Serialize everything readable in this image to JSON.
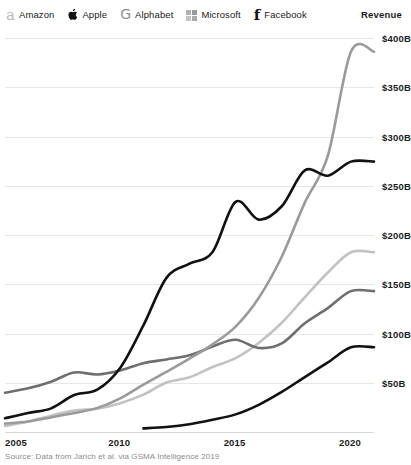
{
  "legend": {
    "revenue_label": "Revenue",
    "items": [
      {
        "label": "Amazon",
        "icon": "amazon-logo-icon",
        "color": "#9a9a9a"
      },
      {
        "label": "Apple",
        "icon": "apple-logo-icon",
        "color": "#111111"
      },
      {
        "label": "Alphabet",
        "icon": "alphabet-logo-icon",
        "color": "#c2c2c2"
      },
      {
        "label": "Microsoft",
        "icon": "microsoft-logo-icon",
        "color": "#6e6e6e"
      },
      {
        "label": "Facebook",
        "icon": "facebook-logo-icon",
        "color": "#111111"
      }
    ]
  },
  "source": "Source: Data from Jarich et al. via GSMA Intelligence 2019",
  "chart_data": {
    "type": "line",
    "title": "",
    "subtitle": "",
    "xlabel": "",
    "ylabel": "Revenue",
    "xlim": [
      2005,
      2021
    ],
    "ylim": [
      0,
      400
    ],
    "grid": true,
    "legend_position": "top",
    "x_ticks": [
      "2005",
      "2010",
      "2015",
      "2020"
    ],
    "x_tick_values": [
      2005,
      2010,
      2015,
      2020
    ],
    "y_ticks": [
      "$50B",
      "$100B",
      "$150B",
      "$200B",
      "$250B",
      "$300B",
      "$350B",
      "$400B"
    ],
    "y_tick_values": [
      50,
      100,
      150,
      200,
      250,
      300,
      350,
      400
    ],
    "unit": "Billions of US dollars",
    "x": [
      2005,
      2006,
      2007,
      2008,
      2009,
      2010,
      2011,
      2012,
      2013,
      2014,
      2015,
      2016,
      2017,
      2018,
      2019,
      2020,
      2021
    ],
    "series": [
      {
        "name": "Amazon",
        "color": "#9a9a9a",
        "values": [
          8.5,
          10.7,
          14.8,
          19.2,
          24.5,
          34.2,
          48.1,
          61.1,
          74.5,
          89.0,
          107.0,
          136.0,
          177.9,
          232.9,
          280.5,
          386.1,
          386.1
        ]
      },
      {
        "name": "Apple",
        "color": "#111111",
        "values": [
          13.9,
          19.3,
          24.0,
          37.5,
          42.9,
          65.2,
          108.2,
          156.5,
          170.9,
          182.8,
          233.7,
          215.6,
          229.2,
          265.6,
          260.2,
          274.5,
          274.5
        ]
      },
      {
        "name": "Alphabet",
        "color": "#c2c2c2",
        "values": [
          6.1,
          10.6,
          16.6,
          21.8,
          23.7,
          29.3,
          37.9,
          50.2,
          55.5,
          66.0,
          74.9,
          90.3,
          110.9,
          136.8,
          161.9,
          182.5,
          182.5
        ]
      },
      {
        "name": "Microsoft",
        "color": "#6e6e6e",
        "values": [
          39.8,
          44.3,
          51.1,
          60.4,
          58.4,
          62.5,
          69.9,
          73.7,
          77.8,
          86.8,
          93.6,
          85.3,
          89.9,
          110.4,
          125.8,
          143.0,
          143.0
        ]
      },
      {
        "name": "Facebook",
        "color": "#111111",
        "values": [
          null,
          null,
          null,
          null,
          null,
          null,
          3.7,
          5.1,
          7.9,
          12.5,
          17.9,
          27.6,
          40.7,
          55.8,
          70.7,
          86.0,
          86.0
        ]
      }
    ]
  }
}
